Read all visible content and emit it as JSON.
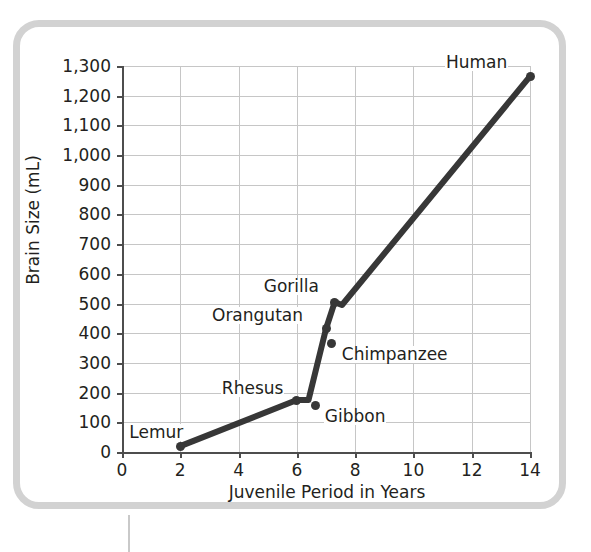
{
  "chart_data": {
    "type": "line",
    "title": "",
    "xlabel": "Juvenile Period in Years",
    "ylabel": "Brain Size (mL)",
    "xlim": [
      0,
      14
    ],
    "ylim": [
      0,
      1300
    ],
    "grid": true,
    "legend": "none",
    "x_ticks": [
      "0",
      "2",
      "4",
      "6",
      "8",
      "10",
      "12",
      "14"
    ],
    "y_ticks": [
      "0",
      "100",
      "200",
      "300",
      "400",
      "500",
      "600",
      "700",
      "800",
      "900",
      "1,000",
      "1,100",
      "1,200",
      "1,300"
    ],
    "x_tick_values": [
      0,
      2,
      4,
      6,
      8,
      10,
      12,
      14
    ],
    "y_tick_values": [
      0,
      100,
      200,
      300,
      400,
      500,
      600,
      700,
      800,
      900,
      1000,
      1100,
      1200,
      1300
    ],
    "series": [
      {
        "name": "Primate brain size vs juvenile period",
        "line_color": "#373737",
        "points": [
          {
            "label": "Lemur",
            "x": 2.0,
            "y": 20,
            "label_dx": -52,
            "label_dy": -22,
            "on_line": true
          },
          {
            "label": "Rhesus",
            "x": 6.0,
            "y": 175,
            "label_dx": -76,
            "label_dy": -20,
            "on_line": true
          },
          {
            "label": "Gibbon",
            "x": 6.65,
            "y": 155,
            "label_dx": 8,
            "label_dy": 2,
            "on_line": false
          },
          {
            "label": "Chimpanzee",
            "x": 7.2,
            "y": 365,
            "label_dx": 9,
            "label_dy": 2,
            "on_line": true
          },
          {
            "label": "Orangutan",
            "x": 7.0,
            "y": 415,
            "label_dx": -115,
            "label_dy": -22,
            "on_line": true
          },
          {
            "label": "Gorilla",
            "x": 7.3,
            "y": 505,
            "label_dx": -72,
            "label_dy": -24,
            "on_line": true
          },
          {
            "label": "Human",
            "x": 14.0,
            "y": 1265,
            "label_dx": -85,
            "label_dy": -22,
            "on_line": true
          }
        ],
        "line_vertices": [
          {
            "x": 2.0,
            "y": 20
          },
          {
            "x": 6.0,
            "y": 175
          },
          {
            "x": 6.4,
            "y": 175
          },
          {
            "x": 7.0,
            "y": 415
          },
          {
            "x": 7.3,
            "y": 505
          },
          {
            "x": 7.55,
            "y": 495
          },
          {
            "x": 14.0,
            "y": 1265
          }
        ]
      }
    ]
  },
  "colors": {
    "line": "#373737",
    "grid": "#c6c6c6",
    "axis": "#4d4d4d",
    "frame": "#d2d2d2",
    "text": "#231f20"
  }
}
